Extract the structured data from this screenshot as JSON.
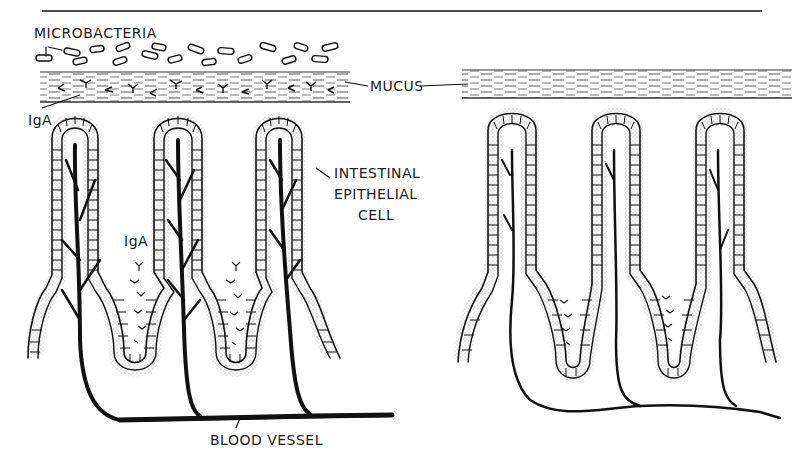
{
  "figure": {
    "type": "scientific illustration",
    "colors": {
      "ink": "#111111",
      "background": "#ffffff",
      "stipple": "#555555"
    },
    "left_panel": {
      "labels": {
        "microbacteria": "MICROBACTERIA",
        "mucus": "MUCUS",
        "iga_top": "IgA",
        "iga_crypt": "IgA",
        "epithelial_line1": "INTESTINAL",
        "epithelial_line2": "EPITHELIAL",
        "epithelial_line3": "CELL",
        "blood_vessel": "BLOOD VESSEL"
      },
      "villi_count": 3,
      "bacteria_present": true,
      "iga_in_mucus": true
    },
    "right_panel": {
      "villi_count": 3,
      "bacteria_present": false,
      "iga_in_mucus": false,
      "description": "mucus layer only, sparse IgA in crypts, simple blood vessels"
    }
  }
}
